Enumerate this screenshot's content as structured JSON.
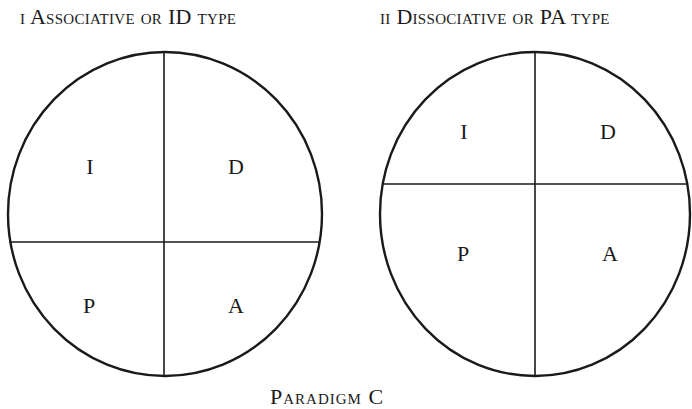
{
  "figure": {
    "caption": "Paradigm C",
    "stroke_color": "#1a1a1a",
    "background": "#ffffff"
  },
  "diagrams": [
    {
      "title": "i Associative or ID type",
      "quadrants": {
        "top_left": "I",
        "top_right": "D",
        "bottom_left": "P",
        "bottom_right": "A"
      },
      "divider": "horizontal line below center (ID region larger)"
    },
    {
      "title": "ii Dissociative or PA type",
      "quadrants": {
        "top_left": "I",
        "top_right": "D",
        "bottom_left": "P",
        "bottom_right": "A"
      },
      "divider": "horizontal line above center (PA region larger)"
    }
  ]
}
